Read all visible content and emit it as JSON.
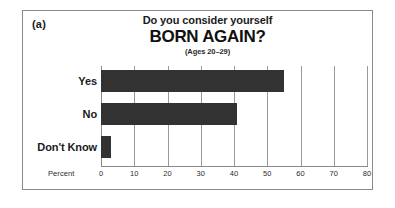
{
  "figure": {
    "panel_label": "(a)",
    "title_line1": "Do you consider yourself",
    "title_line2": "BORN AGAIN?",
    "subtitle": "(Ages 20–29)",
    "axis_title": "Percent",
    "bar_color": "#323232",
    "grid_color": "#9a9a9a",
    "frame_color": "#8a8a8a",
    "background": "#ffffff"
  },
  "chart_data": {
    "type": "bar",
    "orientation": "horizontal",
    "title": "Do you consider yourself BORN AGAIN?",
    "subtitle": "(Ages 20–29)",
    "xlabel": "Percent",
    "ylabel": "",
    "xlim": [
      0,
      80
    ],
    "xticks": [
      0,
      10,
      20,
      30,
      40,
      50,
      60,
      70,
      80
    ],
    "xtick_labels": [
      "0",
      "10",
      "20",
      "30",
      "40",
      "50",
      "60",
      "70",
      "80"
    ],
    "grid": true,
    "legend": false,
    "categories": [
      "Yes",
      "No",
      "Don't Know"
    ],
    "values": [
      55,
      41,
      3
    ],
    "series": [
      {
        "name": "Percent",
        "values": [
          55,
          41,
          3
        ]
      }
    ]
  }
}
